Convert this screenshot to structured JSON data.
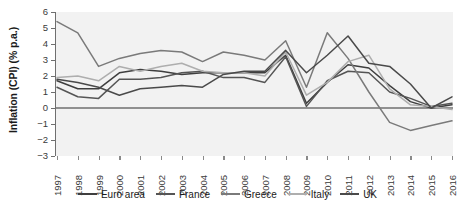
{
  "chart_data": {
    "type": "line",
    "title": "",
    "xlabel": "",
    "ylabel": "Inflation (CPI) (% p.a.)",
    "x": [
      1997,
      1998,
      1999,
      2000,
      2001,
      2002,
      2003,
      2004,
      2005,
      2006,
      2007,
      2008,
      2009,
      2010,
      2011,
      2012,
      2013,
      2014,
      2015,
      2016
    ],
    "xtick_labels": [
      "1997",
      "1998",
      "1999",
      "2000",
      "2001",
      "2002",
      "2003",
      "2004",
      "2005",
      "2006",
      "2007",
      "2008",
      "2009",
      "2010",
      "2011",
      "2012",
      "2013",
      "2014",
      "2015",
      "2016"
    ],
    "ytick_labels": [
      "6",
      "5",
      "4",
      "3",
      "2",
      "1",
      "0",
      "−1",
      "−2",
      "−3"
    ],
    "ytick_values": [
      6,
      5,
      4,
      3,
      2,
      1,
      0,
      -1,
      -2,
      -3
    ],
    "ylim": [
      -3,
      6
    ],
    "xlim": [
      1997,
      2016
    ],
    "grid": false,
    "zero_line": true,
    "legend_position": "bottom",
    "plot_background": "#f2f2f2",
    "series": [
      {
        "name": "Euro area",
        "color": "#3f3f3f",
        "values": [
          1.7,
          1.2,
          1.2,
          2.2,
          2.4,
          2.3,
          2.1,
          2.2,
          2.2,
          2.2,
          2.2,
          3.3,
          0.3,
          1.6,
          2.7,
          2.5,
          1.4,
          0.4,
          0.0,
          0.2
        ]
      },
      {
        "name": "France",
        "color": "#555555",
        "values": [
          1.3,
          0.7,
          0.6,
          1.8,
          1.8,
          1.9,
          2.2,
          2.3,
          1.9,
          1.9,
          1.6,
          3.2,
          0.1,
          1.7,
          2.3,
          2.2,
          1.0,
          0.6,
          0.1,
          0.3
        ]
      },
      {
        "name": "Greece",
        "color": "#7a7a7a",
        "values": [
          5.4,
          4.7,
          2.6,
          3.1,
          3.4,
          3.6,
          3.5,
          2.9,
          3.5,
          3.3,
          3.0,
          4.2,
          1.3,
          4.7,
          3.1,
          1.0,
          -0.9,
          -1.4,
          -1.1,
          -0.8
        ]
      },
      {
        "name": "Italy",
        "color": "#aeaeae",
        "values": [
          1.9,
          2.0,
          1.7,
          2.6,
          2.3,
          2.6,
          2.8,
          2.3,
          2.2,
          2.2,
          2.0,
          3.5,
          0.8,
          1.6,
          2.9,
          3.3,
          1.2,
          0.2,
          0.1,
          -0.1
        ]
      },
      {
        "name": "UK",
        "color": "#4a4a4a",
        "values": [
          1.8,
          1.6,
          1.3,
          0.8,
          1.2,
          1.3,
          1.4,
          1.3,
          2.1,
          2.3,
          2.3,
          3.6,
          2.2,
          3.3,
          4.5,
          2.8,
          2.6,
          1.5,
          0.0,
          0.7
        ]
      }
    ]
  },
  "legend": {
    "items": [
      {
        "label": "Euro area",
        "color": "#3f3f3f"
      },
      {
        "label": "France",
        "color": "#555555"
      },
      {
        "label": "Greece",
        "color": "#7a7a7a"
      },
      {
        "label": "Italy",
        "color": "#aeaeae"
      },
      {
        "label": "UK",
        "color": "#4a4a4a"
      }
    ]
  },
  "axes": {
    "y_title": "Inflation (CPI) (% p.a.)"
  }
}
